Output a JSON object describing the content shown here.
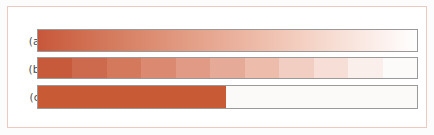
{
  "figure": {
    "background_color": "#fdfcfc",
    "frame_color": "#eec9bf",
    "bar_border_color": "#9a9a9a",
    "label_color": "#4c4c4c"
  },
  "chart_data": {
    "type": "heatmap",
    "title": "",
    "subtitle": "",
    "xlabel": "",
    "ylabel": "",
    "legend_position": "none",
    "grid": false,
    "panels": [
      {
        "label": "(a)",
        "mode": "continuous",
        "colormap": "Oranges_reversed",
        "start_color": "#c8573a",
        "end_color": "#ffffff",
        "stops": [
          {
            "position": 0.0,
            "color": "#c8573a"
          },
          {
            "position": 0.1,
            "color": "#cf6a4c"
          },
          {
            "position": 0.2,
            "color": "#d57c5f"
          },
          {
            "position": 0.3,
            "color": "#dc8d72"
          },
          {
            "position": 0.4,
            "color": "#e39e86"
          },
          {
            "position": 0.5,
            "color": "#e9ae99"
          },
          {
            "position": 0.6,
            "color": "#efbfad"
          },
          {
            "position": 0.7,
            "color": "#f4d0c2"
          },
          {
            "position": 0.8,
            "color": "#f8e0d7"
          },
          {
            "position": 0.9,
            "color": "#fcefeb"
          },
          {
            "position": 1.0,
            "color": "#ffffff"
          }
        ]
      },
      {
        "label": "(b)",
        "mode": "discrete",
        "n_levels": 11,
        "segment_colors": [
          "#c85a3c",
          "#cd6a4d",
          "#d4795c",
          "#db8970",
          "#e09a85",
          "#e6ab98",
          "#edbcab",
          "#f2cec2",
          "#f7dfd7",
          "#fbefeb",
          "#fdfbfa"
        ]
      },
      {
        "label": "(c)",
        "mode": "threshold",
        "n_levels": 2,
        "threshold": 0.497,
        "threshold_percent": "49.7%",
        "segment_colors": [
          "#c85a36",
          "#fbfaf8"
        ]
      }
    ]
  }
}
